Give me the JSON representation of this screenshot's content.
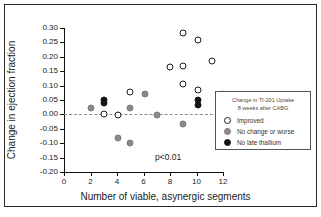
{
  "chart_data": {
    "type": "scatter",
    "title": "",
    "xlabel": "Number of viable, asynergic segments",
    "ylabel": "Change in ejection fraction",
    "xlim": [
      0,
      12
    ],
    "ylim": [
      -0.2,
      0.3
    ],
    "xticks": [
      "0",
      "2",
      "4",
      "6",
      "8",
      "10",
      "12"
    ],
    "xtick_values": [
      0,
      2,
      4,
      6,
      8,
      10,
      12
    ],
    "yticks": [
      "0.30",
      "0.25",
      "0.20",
      "0.15",
      "0.10",
      "0.05",
      "0.00",
      "-0.05",
      "-0.10",
      "-0.15",
      "-0.20"
    ],
    "ytick_values": [
      0.3,
      0.25,
      0.2,
      0.15,
      0.1,
      0.05,
      0.0,
      -0.05,
      -0.1,
      -0.15,
      -0.2
    ],
    "grid": false,
    "zero_reference_line": 0.0,
    "annotation": "p<0.01",
    "legend_position": "right",
    "legend_title": [
      "Change in Tl-201 Uptake",
      "8 weeks after CABG"
    ],
    "series": [
      {
        "name": "Improved",
        "marker": "open-circle",
        "color": "#ffffff",
        "edge_color": "#1b1b1b",
        "points": [
          {
            "x": 3.0,
            "y": 0.0
          },
          {
            "x": 4.1,
            "y": -0.002
          },
          {
            "x": 5.0,
            "y": 0.078
          },
          {
            "x": 8.0,
            "y": 0.165
          },
          {
            "x": 9.0,
            "y": 0.283
          },
          {
            "x": 9.0,
            "y": 0.167
          },
          {
            "x": 9.0,
            "y": 0.106
          },
          {
            "x": 10.1,
            "y": 0.257
          },
          {
            "x": 10.1,
            "y": 0.086
          },
          {
            "x": 11.2,
            "y": 0.187
          }
        ]
      },
      {
        "name": "No change or worse",
        "marker": "gray-circle",
        "color": "#8a8a8a",
        "points": [
          {
            "x": 2.0,
            "y": 0.021
          },
          {
            "x": 4.1,
            "y": -0.083
          },
          {
            "x": 5.0,
            "y": 0.023
          },
          {
            "x": 5.0,
            "y": -0.101
          },
          {
            "x": 6.1,
            "y": 0.07
          },
          {
            "x": 7.0,
            "y": -0.002
          },
          {
            "x": 9.0,
            "y": -0.033
          },
          {
            "x": 11.9,
            "y": 0.07
          }
        ]
      },
      {
        "name": "No late thallium",
        "marker": "filled-circle",
        "color": "#141414",
        "points": [
          {
            "x": 3.0,
            "y": 0.05
          },
          {
            "x": 3.0,
            "y": 0.038
          },
          {
            "x": 10.1,
            "y": 0.049
          },
          {
            "x": 10.1,
            "y": 0.031
          }
        ]
      }
    ]
  },
  "legend": {
    "title_line1": "Change in Tl-201 Uptake",
    "title_line2": "8 weeks after CABG",
    "items": [
      {
        "label": "Improved"
      },
      {
        "label": "No change or worse"
      },
      {
        "label": "No late thallium"
      }
    ]
  },
  "annotation": {
    "pvalue": "p<0.01"
  }
}
